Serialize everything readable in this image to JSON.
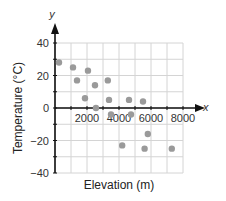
{
  "chart_data": {
    "type": "scatter",
    "title": "",
    "xlabel": "Elevation (m)",
    "ylabel": "Temperature (°C)",
    "x_axis_var": "x",
    "y_axis_var": "y",
    "xlim": [
      0,
      8000
    ],
    "ylim": [
      -40,
      40
    ],
    "x_ticks": [
      2000,
      4000,
      6000,
      8000
    ],
    "y_ticks": [
      40,
      20,
      0,
      -20,
      -40
    ],
    "grid": true,
    "grid_step_x": 1000,
    "grid_step_y": 10,
    "point_color": "#9a9a9a",
    "series": [
      {
        "name": "observations",
        "points": [
          {
            "x": 250,
            "y": 28
          },
          {
            "x": 1125,
            "y": 25
          },
          {
            "x": 2060,
            "y": 23
          },
          {
            "x": 1375,
            "y": 17
          },
          {
            "x": 2500,
            "y": 14
          },
          {
            "x": 3300,
            "y": 17
          },
          {
            "x": 1875,
            "y": 6
          },
          {
            "x": 3375,
            "y": 5
          },
          {
            "x": 4625,
            "y": 5
          },
          {
            "x": 5500,
            "y": 4
          },
          {
            "x": 2560,
            "y": 0
          },
          {
            "x": 3500,
            "y": -4
          },
          {
            "x": 4750,
            "y": -4
          },
          {
            "x": 5800,
            "y": -16
          },
          {
            "x": 4200,
            "y": -23
          },
          {
            "x": 5600,
            "y": -25
          },
          {
            "x": 7300,
            "y": -25
          }
        ]
      }
    ]
  }
}
